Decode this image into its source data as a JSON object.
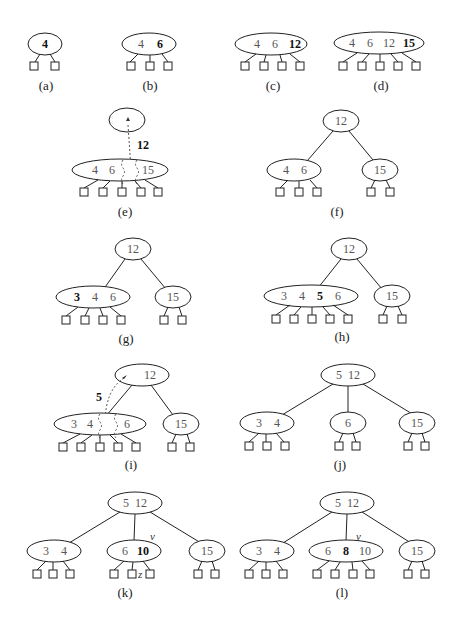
{
  "panels": [
    {
      "id": "a",
      "caption": "(a)",
      "nodes": [
        {
          "keys": [
            "4"
          ],
          "new_key": "4"
        }
      ]
    },
    {
      "id": "b",
      "caption": "(b)",
      "nodes": [
        {
          "keys": [
            "4",
            "6"
          ],
          "new_key": "6"
        }
      ]
    },
    {
      "id": "c",
      "caption": "(c)",
      "nodes": [
        {
          "keys": [
            "4",
            "6",
            "12"
          ],
          "new_key": "12"
        }
      ]
    },
    {
      "id": "d",
      "caption": "(d)",
      "nodes": [
        {
          "keys": [
            "4",
            "6",
            "12",
            "15"
          ],
          "new_key": "15"
        }
      ]
    },
    {
      "id": "e",
      "caption": "(e)",
      "split_key": "12",
      "nodes": [
        {
          "keys": [
            "4",
            "6",
            "",
            "15"
          ]
        },
        {
          "keys": [],
          "role": "new-parent"
        }
      ]
    },
    {
      "id": "f",
      "caption": "(f)",
      "nodes": [
        {
          "keys": [
            "12"
          ],
          "role": "root"
        },
        {
          "keys": [
            "4",
            "6"
          ]
        },
        {
          "keys": [
            "15"
          ]
        }
      ]
    },
    {
      "id": "g",
      "caption": "(g)",
      "nodes": [
        {
          "keys": [
            "12"
          ],
          "role": "root"
        },
        {
          "keys": [
            "3",
            "4",
            "6"
          ],
          "new_key": "3"
        },
        {
          "keys": [
            "15"
          ]
        }
      ]
    },
    {
      "id": "h",
      "caption": "(h)",
      "nodes": [
        {
          "keys": [
            "12"
          ],
          "role": "root"
        },
        {
          "keys": [
            "3",
            "4",
            "5",
            "6"
          ],
          "new_key": "5"
        },
        {
          "keys": [
            "15"
          ]
        }
      ]
    },
    {
      "id": "i",
      "caption": "(i)",
      "split_key": "5",
      "nodes": [
        {
          "keys": [
            "12"
          ],
          "role": "root"
        },
        {
          "keys": [
            "3",
            "4",
            "",
            "6"
          ]
        },
        {
          "keys": [
            "15"
          ]
        }
      ]
    },
    {
      "id": "j",
      "caption": "(j)",
      "nodes": [
        {
          "keys": [
            "5",
            "12"
          ],
          "role": "root"
        },
        {
          "keys": [
            "3",
            "4"
          ]
        },
        {
          "keys": [
            "6"
          ]
        },
        {
          "keys": [
            "15"
          ]
        }
      ]
    },
    {
      "id": "k",
      "caption": "(k)",
      "node_label": "v",
      "leaf_label": "z",
      "nodes": [
        {
          "keys": [
            "5",
            "12"
          ],
          "role": "root"
        },
        {
          "keys": [
            "3",
            "4"
          ]
        },
        {
          "keys": [
            "6",
            "10"
          ],
          "new_key": "10"
        },
        {
          "keys": [
            "15"
          ]
        }
      ]
    },
    {
      "id": "l",
      "caption": "(l)",
      "node_label": "v",
      "nodes": [
        {
          "keys": [
            "5",
            "12"
          ],
          "role": "root"
        },
        {
          "keys": [
            "3",
            "4"
          ]
        },
        {
          "keys": [
            "6",
            "8",
            "10"
          ],
          "new_key": "8"
        },
        {
          "keys": [
            "15"
          ]
        }
      ]
    }
  ],
  "labels": {
    "a_k1": "4",
    "b_k1": "4",
    "b_k2": "6",
    "c_k1": "4",
    "c_k2": "6",
    "c_k3": "12",
    "d_k1": "4",
    "d_k2": "6",
    "d_k3": "12",
    "d_k4": "15",
    "e_split": "12",
    "e_k1": "4",
    "e_k2": "6",
    "e_k4": "15",
    "f_root": "12",
    "f_l1": "4",
    "f_l2": "6",
    "f_r1": "15",
    "g_root": "12",
    "g_l1": "3",
    "g_l2": "4",
    "g_l3": "6",
    "g_r1": "15",
    "h_root": "12",
    "h_l1": "3",
    "h_l2": "4",
    "h_l3": "5",
    "h_l4": "6",
    "h_r1": "15",
    "i_root": "12",
    "i_split": "5",
    "i_l1": "3",
    "i_l2": "4",
    "i_l4": "6",
    "i_r1": "15",
    "j_root": "5  12",
    "j_a1": "3",
    "j_a2": "4",
    "j_b1": "6",
    "j_c1": "15",
    "k_root": "5  12",
    "k_a1": "3",
    "k_a2": "4",
    "k_b1": "6",
    "k_b2": "10",
    "k_c1": "15",
    "k_v": "v",
    "k_z": "z",
    "l_root": "5  12",
    "l_a1": "3",
    "l_a2": "4",
    "l_b1": "6",
    "l_b2": "8",
    "l_b3": "10",
    "l_c1": "15",
    "l_v": "v",
    "cap_a": "(a)",
    "cap_b": "(b)",
    "cap_c": "(c)",
    "cap_d": "(d)",
    "cap_e": "(e)",
    "cap_f": "(f)",
    "cap_g": "(g)",
    "cap_h": "(h)",
    "cap_i": "(i)",
    "cap_j": "(j)",
    "cap_k": "(k)",
    "cap_l": "(l)"
  }
}
